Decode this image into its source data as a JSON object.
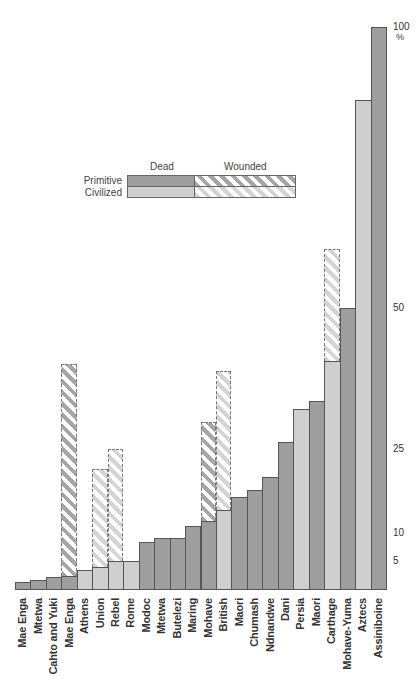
{
  "chart_data": {
    "type": "bar",
    "stacked": true,
    "title": "",
    "xlabel": "",
    "ylabel": "%",
    "ylim": [
      0,
      100
    ],
    "yticks": [
      5,
      10,
      25,
      50,
      100
    ],
    "ytick_labels": [
      "5",
      "10",
      "25",
      "50",
      "100"
    ],
    "y_unit": "%",
    "grid": false,
    "legend": {
      "position": "upper-left-center",
      "columns": [
        "Dead",
        "Wounded"
      ],
      "rows": [
        "Primitive",
        "Civilized"
      ]
    },
    "categories": [
      "Mae Enga",
      "Mtetwa",
      "Cahto and Yuki",
      "Mae Enga",
      "Athens",
      "Union",
      "Rebel",
      "Rome",
      "Modoc",
      "Mtetwa",
      "Butelezi",
      "Maring",
      "Mohave",
      "British",
      "Maori",
      "Chumash",
      "Ndnandwe",
      "Dani",
      "Persia",
      "Maori",
      "Carthage",
      "Mohave-Yuma",
      "Aztecs",
      "Assiniboine"
    ],
    "group": [
      "Primitive",
      "Primitive",
      "Primitive",
      "Primitive",
      "Civilized",
      "Civilized",
      "Civilized",
      "Civilized",
      "Primitive",
      "Primitive",
      "Primitive",
      "Primitive",
      "Primitive",
      "Civilized",
      "Primitive",
      "Primitive",
      "Primitive",
      "Primitive",
      "Civilized",
      "Primitive",
      "Civilized",
      "Primitive",
      "Civilized",
      "Primitive"
    ],
    "series": [
      {
        "name": "Dead",
        "values": [
          1.2,
          1.6,
          2.2,
          2.3,
          3.4,
          3.9,
          4.9,
          5.0,
          8.4,
          9.1,
          9.1,
          11.2,
          12.1,
          14.1,
          16.4,
          17.6,
          19.9,
          26.1,
          32.1,
          33.5,
          40.5,
          50.0,
          87.0,
          100.0
        ]
      },
      {
        "name": "Wounded (total incl. dead)",
        "values": [
          null,
          null,
          null,
          40.0,
          null,
          21.4,
          24.9,
          null,
          null,
          null,
          null,
          null,
          29.7,
          38.8,
          null,
          null,
          null,
          null,
          null,
          null,
          60.5,
          null,
          null,
          null
        ]
      }
    ]
  },
  "legend": {
    "dead_label": "Dead",
    "wounded_label": "Wounded",
    "primitive_label": "Primitive",
    "civilized_label": "Civilized"
  },
  "axis": {
    "unit": "%",
    "ticks": [
      {
        "label": "100",
        "value": 100
      },
      {
        "label": "50",
        "value": 50
      },
      {
        "label": "25",
        "value": 25
      },
      {
        "label": "10",
        "value": 10
      },
      {
        "label": "5",
        "value": 5
      }
    ]
  },
  "colors": {
    "primitive": "#9e9e9e",
    "civilized": "#cfcfcf"
  }
}
